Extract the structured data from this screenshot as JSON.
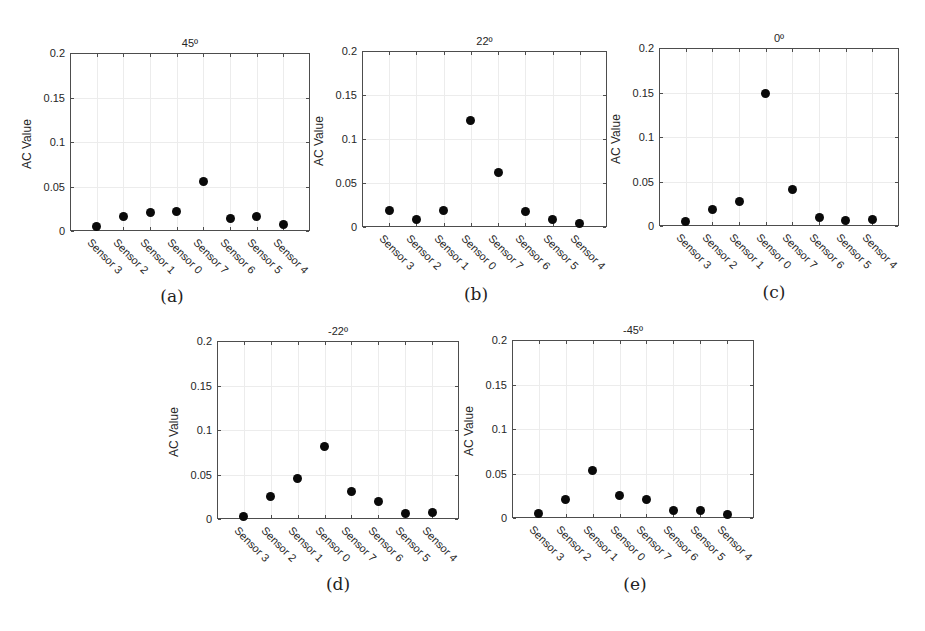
{
  "figure": {
    "y_axis_label": "AC Value",
    "y_ticks": [
      "0",
      "0.05",
      "0.1",
      "0.15",
      "0.2"
    ],
    "categories": [
      "Sensor 3",
      "Sensor 2",
      "Sensor 1",
      "Sensor 0",
      "Sensor 7",
      "Sensor 6",
      "Sensor 5",
      "Sensor 4"
    ],
    "marker_color": "#0a0a0a",
    "panels": [
      {
        "id": "a",
        "title": "45º",
        "caption": "(a)"
      },
      {
        "id": "b",
        "title": "22º",
        "caption": "(b)"
      },
      {
        "id": "c",
        "title": "0º",
        "caption": "(c)"
      },
      {
        "id": "d",
        "title": "-22º",
        "caption": "(d)"
      },
      {
        "id": "e",
        "title": "-45º",
        "caption": "(e)"
      }
    ]
  },
  "chart_data": [
    {
      "type": "scatter",
      "title": "45º",
      "caption": "(a)",
      "xlabel": "",
      "ylabel": "AC Value",
      "ylim": [
        0,
        0.2
      ],
      "grid": true,
      "categories": [
        "Sensor 3",
        "Sensor 2",
        "Sensor 1",
        "Sensor 0",
        "Sensor 7",
        "Sensor 6",
        "Sensor 5",
        "Sensor 4"
      ],
      "values": [
        0.005,
        0.016,
        0.021,
        0.022,
        0.056,
        0.014,
        0.016,
        0.007
      ]
    },
    {
      "type": "scatter",
      "title": "22º",
      "caption": "(b)",
      "xlabel": "",
      "ylabel": "AC Value",
      "ylim": [
        0,
        0.2
      ],
      "grid": true,
      "categories": [
        "Sensor 3",
        "Sensor 2",
        "Sensor 1",
        "Sensor 0",
        "Sensor 7",
        "Sensor 6",
        "Sensor 5",
        "Sensor 4"
      ],
      "values": [
        0.019,
        0.008,
        0.019,
        0.121,
        0.062,
        0.018,
        0.008,
        0.004
      ]
    },
    {
      "type": "scatter",
      "title": "0º",
      "caption": "(c)",
      "xlabel": "",
      "ylabel": "AC Value",
      "ylim": [
        0,
        0.2
      ],
      "grid": true,
      "categories": [
        "Sensor 3",
        "Sensor 2",
        "Sensor 1",
        "Sensor 0",
        "Sensor 7",
        "Sensor 6",
        "Sensor 5",
        "Sensor 4"
      ],
      "values": [
        0.005,
        0.018,
        0.028,
        0.149,
        0.041,
        0.01,
        0.006,
        0.007
      ]
    },
    {
      "type": "scatter",
      "title": "-22º",
      "caption": "(d)",
      "xlabel": "",
      "ylabel": "AC Value",
      "ylim": [
        0,
        0.2
      ],
      "grid": true,
      "categories": [
        "Sensor 3",
        "Sensor 2",
        "Sensor 1",
        "Sensor 0",
        "Sensor 7",
        "Sensor 6",
        "Sensor 5",
        "Sensor 4"
      ],
      "values": [
        0.003,
        0.025,
        0.045,
        0.082,
        0.031,
        0.02,
        0.006,
        0.007
      ]
    },
    {
      "type": "scatter",
      "title": "-45º",
      "caption": "(e)",
      "xlabel": "",
      "ylabel": "AC Value",
      "ylim": [
        0,
        0.2
      ],
      "grid": true,
      "categories": [
        "Sensor 3",
        "Sensor 2",
        "Sensor 1",
        "Sensor 0",
        "Sensor 7",
        "Sensor 6",
        "Sensor 5",
        "Sensor 4"
      ],
      "values": [
        0.005,
        0.021,
        0.053,
        0.025,
        0.021,
        0.008,
        0.008,
        0.004
      ]
    }
  ]
}
